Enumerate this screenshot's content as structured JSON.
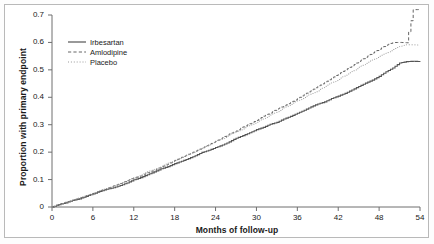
{
  "chart_data": {
    "type": "line",
    "title": "",
    "xlabel": "Months of follow-up",
    "ylabel": "Proportion with primary endpoint",
    "xlim": [
      0,
      54
    ],
    "ylim": [
      0,
      0.7
    ],
    "xticks": [
      "0",
      "6",
      "12",
      "18",
      "24",
      "30",
      "36",
      "42",
      "48",
      "54"
    ],
    "xtick_values": [
      0,
      6,
      12,
      18,
      24,
      30,
      36,
      42,
      48,
      54
    ],
    "yticks": [
      "0",
      "0.1",
      "0.2",
      "0.3",
      "0.4",
      "0.5",
      "0.6",
      "0.7"
    ],
    "ytick_values": [
      0,
      0.1,
      0.2,
      0.3,
      0.4,
      0.5,
      0.6,
      0.7
    ],
    "grid": false,
    "legend_position": "upper left",
    "series": [
      {
        "name": "Irbesartan",
        "style": "solid",
        "color": "#555555",
        "x": [
          0,
          1,
          2,
          3,
          4,
          5,
          6,
          7,
          8,
          9,
          10,
          11,
          12,
          13,
          14,
          15,
          16,
          17,
          18,
          19,
          20,
          21,
          22,
          23,
          24,
          25,
          26,
          27,
          28,
          29,
          30,
          31,
          32,
          33,
          34,
          35,
          36,
          37,
          38,
          39,
          40,
          41,
          42,
          43,
          44,
          45,
          46,
          47,
          48,
          49,
          50,
          51,
          52,
          53,
          54
        ],
        "y": [
          0,
          0.008,
          0.016,
          0.024,
          0.031,
          0.039,
          0.047,
          0.055,
          0.063,
          0.072,
          0.08,
          0.089,
          0.098,
          0.108,
          0.118,
          0.128,
          0.138,
          0.148,
          0.158,
          0.168,
          0.178,
          0.188,
          0.198,
          0.208,
          0.218,
          0.228,
          0.239,
          0.25,
          0.261,
          0.272,
          0.283,
          0.292,
          0.3,
          0.31,
          0.32,
          0.33,
          0.34,
          0.352,
          0.364,
          0.374,
          0.384,
          0.394,
          0.404,
          0.416,
          0.428,
          0.44,
          0.452,
          0.464,
          0.476,
          0.492,
          0.508,
          0.524,
          0.53,
          0.53,
          0.53
        ]
      },
      {
        "name": "Amlodipine",
        "style": "dashed",
        "color": "#666666",
        "x": [
          0,
          1,
          2,
          3,
          4,
          5,
          6,
          7,
          8,
          9,
          10,
          11,
          12,
          13,
          14,
          15,
          16,
          17,
          18,
          19,
          20,
          21,
          22,
          23,
          24,
          25,
          26,
          27,
          28,
          29,
          30,
          31,
          32,
          33,
          34,
          35,
          36,
          37,
          38,
          39,
          40,
          41,
          42,
          43,
          44,
          45,
          46,
          47,
          48,
          49,
          50,
          51,
          52,
          53,
          54
        ],
        "y": [
          0,
          0.008,
          0.017,
          0.025,
          0.033,
          0.041,
          0.05,
          0.058,
          0.067,
          0.076,
          0.085,
          0.095,
          0.105,
          0.115,
          0.126,
          0.136,
          0.147,
          0.158,
          0.169,
          0.18,
          0.192,
          0.204,
          0.216,
          0.228,
          0.24,
          0.252,
          0.265,
          0.278,
          0.291,
          0.304,
          0.317,
          0.33,
          0.343,
          0.356,
          0.369,
          0.382,
          0.395,
          0.41,
          0.425,
          0.44,
          0.455,
          0.47,
          0.485,
          0.5,
          0.515,
          0.53,
          0.545,
          0.56,
          0.575,
          0.59,
          0.6,
          0.6,
          0.6,
          0.72,
          0.72
        ]
      },
      {
        "name": "Placebo",
        "style": "dotted",
        "color": "#999999",
        "x": [
          0,
          1,
          2,
          3,
          4,
          5,
          6,
          7,
          8,
          9,
          10,
          11,
          12,
          13,
          14,
          15,
          16,
          17,
          18,
          19,
          20,
          21,
          22,
          23,
          24,
          25,
          26,
          27,
          28,
          29,
          30,
          31,
          32,
          33,
          34,
          35,
          36,
          37,
          38,
          39,
          40,
          41,
          42,
          43,
          44,
          45,
          46,
          47,
          48,
          49,
          50,
          51,
          52,
          53,
          54
        ],
        "y": [
          0,
          0.008,
          0.017,
          0.025,
          0.033,
          0.042,
          0.05,
          0.059,
          0.068,
          0.077,
          0.086,
          0.096,
          0.106,
          0.116,
          0.127,
          0.137,
          0.148,
          0.159,
          0.17,
          0.181,
          0.192,
          0.203,
          0.214,
          0.226,
          0.238,
          0.25,
          0.262,
          0.274,
          0.286,
          0.298,
          0.31,
          0.322,
          0.334,
          0.347,
          0.36,
          0.373,
          0.386,
          0.399,
          0.412,
          0.425,
          0.438,
          0.452,
          0.466,
          0.48,
          0.494,
          0.508,
          0.522,
          0.536,
          0.55,
          0.562,
          0.574,
          0.586,
          0.59,
          0.59,
          0.59
        ]
      }
    ]
  },
  "legend": {
    "items": [
      {
        "label": "Irbesartan",
        "style": "solid"
      },
      {
        "label": "Amlodipine",
        "style": "dashed"
      },
      {
        "label": "Placebo",
        "style": "dotted"
      }
    ]
  }
}
